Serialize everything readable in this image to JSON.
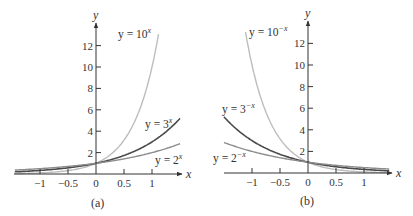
{
  "chart_data": [
    {
      "type": "line",
      "panel": "a",
      "caption": "(a)",
      "xlabel": "x",
      "ylabel": "y",
      "xlim": [
        -1.45,
        1.5
      ],
      "ylim": [
        0,
        14
      ],
      "x_ticks": [
        "-1",
        "-0.5",
        "0",
        "0.5",
        "1"
      ],
      "y_ticks": [
        "2",
        "4",
        "6",
        "8",
        "10",
        "12"
      ],
      "grid": false,
      "series": [
        {
          "name": "y = 10^x",
          "label_base": "y = 10",
          "label_exp": "x",
          "base": 10,
          "sign": 1,
          "color": "#bdbdbd",
          "x": [
            -1.45,
            -1,
            -0.5,
            0,
            0.5,
            1,
            1.12
          ],
          "values": [
            0.035,
            0.1,
            0.32,
            1,
            3.16,
            10,
            13.2
          ]
        },
        {
          "name": "y = 3^x",
          "label_base": "y = 3",
          "label_exp": "x",
          "base": 3,
          "sign": 1,
          "color": "#4a4a4a",
          "x": [
            -1.45,
            -1,
            -0.5,
            0,
            0.5,
            1,
            1.5
          ],
          "values": [
            0.2,
            0.33,
            0.58,
            1,
            1.73,
            3,
            5.2
          ]
        },
        {
          "name": "y = 2^x",
          "label_base": "y = 2",
          "label_exp": "x",
          "base": 2,
          "sign": 1,
          "color": "#8c8c8c",
          "x": [
            -1.45,
            -1,
            -0.5,
            0,
            0.5,
            1,
            1.5
          ],
          "values": [
            0.37,
            0.5,
            0.71,
            1,
            1.41,
            2,
            2.83
          ]
        }
      ]
    },
    {
      "type": "line",
      "panel": "b",
      "caption": "(b)",
      "xlabel": "x",
      "ylabel": "y",
      "xlim": [
        -1.5,
        1.45
      ],
      "ylim": [
        0,
        14
      ],
      "x_ticks": [
        "-1",
        "-0.5",
        "0",
        "0.5",
        "1"
      ],
      "y_ticks": [
        "2",
        "4",
        "6",
        "8",
        "10",
        "12"
      ],
      "grid": false,
      "series": [
        {
          "name": "y = 10^-x",
          "label_base": "y = 10",
          "label_exp": "−x",
          "base": 10,
          "sign": -1,
          "color": "#bdbdbd",
          "x": [
            -1.12,
            -1,
            -0.5,
            0,
            0.5,
            1,
            1.45
          ],
          "values": [
            13.2,
            10,
            3.16,
            1,
            0.32,
            0.1,
            0.035
          ]
        },
        {
          "name": "y = 3^-x",
          "label_base": "y = 3",
          "label_exp": "−x",
          "base": 3,
          "sign": -1,
          "color": "#4a4a4a",
          "x": [
            -1.5,
            -1,
            -0.5,
            0,
            0.5,
            1,
            1.45
          ],
          "values": [
            5.2,
            3,
            1.73,
            1,
            0.58,
            0.33,
            0.2
          ]
        },
        {
          "name": "y = 2^-x",
          "label_base": "y = 2",
          "label_exp": "−x",
          "base": 2,
          "sign": -1,
          "color": "#8c8c8c",
          "x": [
            -1.5,
            -1,
            -0.5,
            0,
            0.5,
            1,
            1.45
          ],
          "values": [
            2.83,
            2,
            1.41,
            1,
            0.71,
            0.5,
            0.37
          ]
        }
      ]
    }
  ]
}
